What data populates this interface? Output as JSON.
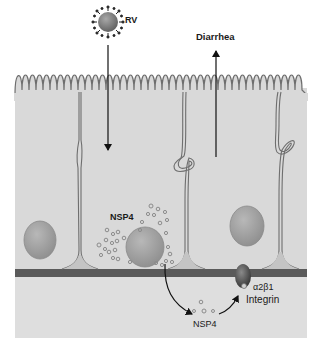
{
  "figure": {
    "type": "biological-pathway-diagram"
  },
  "labels": {
    "virus": "RV",
    "outcome": "Diarrhea",
    "nsp4_intracellular": "NSP4",
    "nsp4_secreted": "NSP4",
    "receptor_line1": "α2β1",
    "receptor_line2": "Integrin"
  },
  "colors": {
    "background": "#ffffff",
    "tissue": "#d9d9d9",
    "cell_fill": "#d4d4d4",
    "lamina": "#dcdcdc",
    "membrane_line": "#6e6e6e",
    "basement_membrane": "#5a5a5a",
    "nucleus": "#9a9a9a",
    "virus": "#808080",
    "arrow": "#111111",
    "vesicle": "#8c8c8c",
    "integrin": "#4a4a4a"
  },
  "elements": [
    {
      "id": "rotavirus",
      "label": "RV",
      "position": [
        108,
        20
      ]
    },
    {
      "id": "entry-arrow",
      "direction": "down",
      "from": [
        108,
        45
      ],
      "to": [
        108,
        152
      ]
    },
    {
      "id": "diarrhea-arrow",
      "direction": "up",
      "from": [
        216,
        157
      ],
      "to": [
        216,
        48
      ]
    },
    {
      "id": "infected-cell-nucleus",
      "position": [
        145,
        247
      ]
    },
    {
      "id": "left-cell-nucleus",
      "position": [
        40,
        240
      ]
    },
    {
      "id": "right-cell-nucleus",
      "position": [
        247,
        226
      ]
    },
    {
      "id": "secretion-arrow",
      "from": [
        165,
        272
      ],
      "to": [
        195,
        318
      ]
    },
    {
      "id": "binding-arrow",
      "from": [
        220,
        315
      ],
      "to": [
        238,
        294
      ]
    },
    {
      "id": "integrin-receptor",
      "label": "α2β1 Integrin",
      "position": [
        243,
        275
      ]
    }
  ]
}
